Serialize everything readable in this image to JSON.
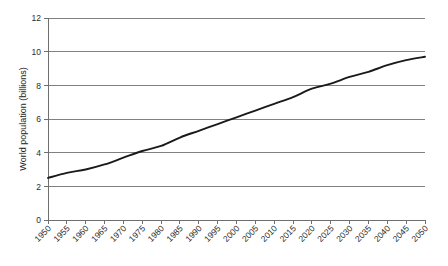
{
  "chart_data": {
    "type": "line",
    "title": "",
    "xlabel": "",
    "ylabel": "World population (billions)",
    "xlim": [
      1950,
      2050
    ],
    "ylim": [
      0,
      12
    ],
    "grid": true,
    "legend": "none",
    "x_tick_labels": [
      "1950",
      "1955",
      "1960",
      "1965",
      "1970",
      "1975",
      "1980",
      "1985",
      "1990",
      "1995",
      "2000",
      "2005",
      "2010",
      "2015",
      "2020",
      "2025",
      "2030",
      "2035",
      "2040",
      "2045",
      "2050"
    ],
    "y_tick_labels": [
      "0",
      "2",
      "4",
      "6",
      "8",
      "10",
      "12"
    ],
    "y_tick_values": [
      0,
      2,
      4,
      6,
      8,
      10,
      12
    ],
    "series": [
      {
        "name": "World population",
        "color": "#1a1a1a",
        "x": [
          1950,
          1955,
          1960,
          1965,
          1970,
          1975,
          1980,
          1985,
          1990,
          1995,
          2000,
          2005,
          2010,
          2015,
          2020,
          2025,
          2030,
          2035,
          2040,
          2045,
          2050
        ],
        "values": [
          2.5,
          2.8,
          3.0,
          3.3,
          3.7,
          4.1,
          4.4,
          4.9,
          5.3,
          5.7,
          6.1,
          6.5,
          6.9,
          7.3,
          7.8,
          8.1,
          8.5,
          8.8,
          9.2,
          9.5,
          9.7
        ]
      }
    ]
  }
}
